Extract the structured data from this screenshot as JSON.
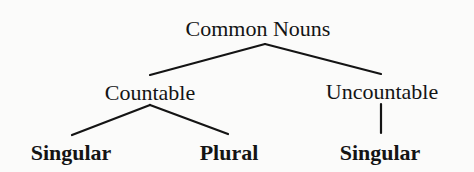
{
  "diagram": {
    "type": "tree",
    "title": "Common Nouns",
    "root": {
      "label": "Common Nouns",
      "children": [
        {
          "label": "Countable",
          "children": [
            {
              "label": "Singular"
            },
            {
              "label": "Plural"
            }
          ]
        },
        {
          "label": "Uncountable",
          "children": [
            {
              "label": "Singular"
            }
          ]
        }
      ]
    }
  },
  "nodes": {
    "root": "Common Nouns",
    "countable": "Countable",
    "uncountable": "Uncountable",
    "countable_singular": "Singular",
    "countable_plural": "Plural",
    "uncountable_singular": "Singular"
  },
  "colors": {
    "ink": "#141414",
    "background": "#fbfbfa"
  }
}
